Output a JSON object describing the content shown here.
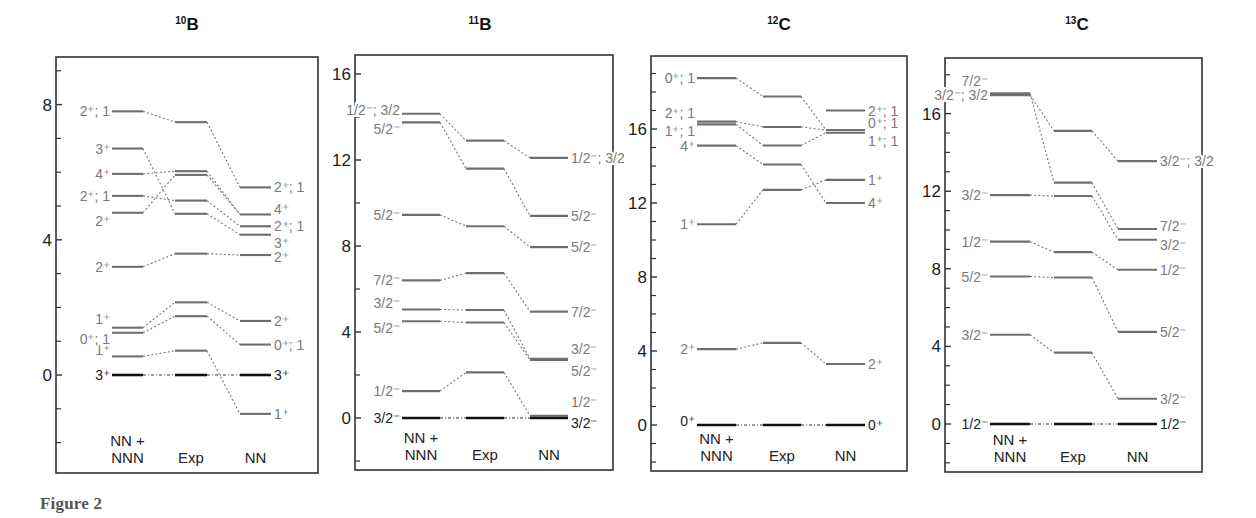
{
  "caption": "Figure 2",
  "colors": {
    "axis": "#333333",
    "level": "#6e6e6e",
    "ground": "#111111",
    "label": "#7a7a7a",
    "ground_label": "#222222",
    "tick_label": "#222222",
    "connector": "#777777"
  },
  "chart_data": [
    {
      "type": "level-scheme",
      "title": "10B",
      "title_mass": "10",
      "title_element": "B",
      "ylabel": "Excitation energy (MeV)",
      "ylim": [
        -2.9,
        9.6
      ],
      "yticks_major": [
        0,
        4,
        8
      ],
      "yticks_minor": [
        -2,
        -1,
        1,
        2,
        3,
        5,
        6,
        7,
        9
      ],
      "columns": [
        "NN +\nNNN",
        "Exp",
        "NN"
      ],
      "column_labels": [
        [
          "NN +",
          "NNN"
        ],
        [
          "Exp"
        ],
        [
          "NN"
        ]
      ],
      "series": [
        {
          "name": "NN + NNN",
          "levels": [
            {
              "E": 0.0,
              "label": "3⁺",
              "ground": true
            },
            {
              "E": 0.55,
              "label": "1⁺"
            },
            {
              "E": 1.25,
              "label": "0⁺; 1"
            },
            {
              "E": 1.4,
              "label": "1⁺"
            },
            {
              "E": 3.2,
              "label": "2⁺"
            },
            {
              "E": 4.8,
              "label": "2⁺"
            },
            {
              "E": 5.3,
              "label": "2⁺; 1"
            },
            {
              "E": 5.95,
              "label": "4⁺"
            },
            {
              "E": 6.7,
              "label": "3⁺"
            },
            {
              "E": 7.8,
              "label": "2⁺; 1"
            }
          ]
        },
        {
          "name": "Exp",
          "levels": [
            {
              "E": 0.0,
              "ground": true
            },
            {
              "E": 0.72
            },
            {
              "E": 1.74
            },
            {
              "E": 2.15
            },
            {
              "E": 3.59
            },
            {
              "E": 4.77
            },
            {
              "E": 5.16
            },
            {
              "E": 5.92
            },
            {
              "E": 6.03
            },
            {
              "E": 7.48
            }
          ]
        },
        {
          "name": "NN",
          "levels": [
            {
              "E": -1.15,
              "label": "1⁺"
            },
            {
              "E": 0.0,
              "label": "3⁺",
              "ground": true
            },
            {
              "E": 0.9,
              "label": "0⁺; 1"
            },
            {
              "E": 1.6,
              "label": "2⁺"
            },
            {
              "E": 3.55,
              "label": "2⁺"
            },
            {
              "E": 4.15,
              "label": "3⁺"
            },
            {
              "E": 4.4,
              "label": "2⁺; 1"
            },
            {
              "E": 4.75,
              "label": "4⁺"
            },
            {
              "E": 5.55,
              "label": "2⁺; 1"
            }
          ]
        }
      ],
      "connections": [
        [
          0,
          0,
          0
        ],
        [
          1,
          1,
          -1.15
        ],
        [
          2,
          2,
          0.9
        ],
        [
          3,
          3,
          1.6
        ],
        [
          4,
          4,
          3.55
        ],
        [
          5,
          8,
          4.75
        ],
        [
          6,
          6,
          4.4
        ],
        [
          7,
          7,
          4.15
        ],
        [
          8,
          9,
          5.55
        ],
        [
          9,
          5,
          3.55
        ]
      ]
    },
    {
      "type": "level-scheme",
      "title": "11B",
      "title_mass": "11",
      "title_element": "B",
      "ylabel": "Excitation energy (MeV)",
      "ylim": [
        -2.5,
        16.8
      ],
      "yticks_major": [
        0,
        4,
        8,
        12,
        16
      ],
      "yticks_minor": [
        -2,
        2,
        6,
        10,
        14
      ],
      "columns": [
        "NN +\nNNN",
        "Exp",
        "NN"
      ],
      "column_labels": [
        [
          "NN +",
          "NNN"
        ],
        [
          "Exp"
        ],
        [
          "NN"
        ]
      ],
      "series": [
        {
          "name": "NN + NNN",
          "levels": [
            {
              "E": 0.0,
              "label": "3/2⁻",
              "ground": true
            },
            {
              "E": 1.25,
              "label": "1/2⁻"
            },
            {
              "E": 4.5,
              "label": "5/2⁻"
            },
            {
              "E": 5.05,
              "label": "3/2⁻"
            },
            {
              "E": 6.4,
              "label": "7/2⁻"
            },
            {
              "E": 9.45,
              "label": "5/2⁻"
            },
            {
              "E": 13.75,
              "label": "5/2⁻"
            },
            {
              "E": 14.15,
              "label": "1/2⁻; 3/2"
            }
          ]
        },
        {
          "name": "Exp",
          "levels": [
            {
              "E": 0.0,
              "ground": true
            },
            {
              "E": 2.12
            },
            {
              "E": 4.44
            },
            {
              "E": 5.02
            },
            {
              "E": 6.74
            },
            {
              "E": 8.92
            },
            {
              "E": 11.6
            },
            {
              "E": 12.9
            }
          ]
        },
        {
          "name": "NN",
          "levels": [
            {
              "E": 0.0,
              "label": "3/2⁻",
              "ground": true
            },
            {
              "E": 0.1,
              "label": "1/2⁻"
            },
            {
              "E": 2.7,
              "label": "5/2⁻"
            },
            {
              "E": 2.75,
              "label": "3/2⁻"
            },
            {
              "E": 4.95,
              "label": "7/2⁻"
            },
            {
              "E": 7.95,
              "label": "5/2⁻"
            },
            {
              "E": 9.4,
              "label": "5/2⁻"
            },
            {
              "E": 12.1,
              "label": "1/2⁻; 3/2"
            }
          ]
        }
      ]
    },
    {
      "type": "level-scheme",
      "title": "12C",
      "title_mass": "12",
      "title_element": "C",
      "ylabel": "Excitation energy (MeV)",
      "ylim": [
        -2.5,
        20.0
      ],
      "yticks_major": [
        0,
        4,
        8,
        12,
        16
      ],
      "yticks_minor": [
        -2,
        -1,
        1,
        2,
        3,
        5,
        6,
        7,
        9,
        10,
        11,
        13,
        14,
        15,
        17,
        18,
        19
      ],
      "columns": [
        "NN +\nNNN",
        "Exp",
        "NN"
      ],
      "column_labels": [
        [
          "NN +",
          "NNN"
        ],
        [
          "Exp"
        ],
        [
          "NN"
        ]
      ],
      "series": [
        {
          "name": "NN + NNN",
          "levels": [
            {
              "E": 0.0,
              "label": "0⁺",
              "ground": true
            },
            {
              "E": 4.1,
              "label": "2⁺"
            },
            {
              "E": 10.85,
              "label": "1⁺"
            },
            {
              "E": 15.1,
              "label": "4⁺"
            },
            {
              "E": 16.25,
              "label": "1⁺; 1"
            },
            {
              "E": 16.4,
              "label": "2⁺; 1"
            },
            {
              "E": 18.75,
              "label": "0⁺; 1"
            }
          ]
        },
        {
          "name": "Exp",
          "levels": [
            {
              "E": 0.0,
              "ground": true
            },
            {
              "E": 4.44
            },
            {
              "E": 12.71
            },
            {
              "E": 14.08
            },
            {
              "E": 15.11
            },
            {
              "E": 16.11
            },
            {
              "E": 17.76
            }
          ]
        },
        {
          "name": "NN",
          "levels": [
            {
              "E": 0.0,
              "label": "0⁺",
              "ground": true
            },
            {
              "E": 3.3,
              "label": "2⁺"
            },
            {
              "E": 12.0,
              "label": "4⁺"
            },
            {
              "E": 13.25,
              "label": "1⁺"
            },
            {
              "E": 15.8,
              "label": "1⁺; 1"
            },
            {
              "E": 15.95,
              "label": "0⁺; 1"
            },
            {
              "E": 17.0,
              "label": "2⁺; 1"
            }
          ]
        }
      ]
    },
    {
      "type": "level-scheme",
      "title": "13C",
      "title_mass": "13",
      "title_element": "C",
      "ylabel": "Excitation energy (MeV)",
      "ylim": [
        -2.5,
        18.8
      ],
      "yticks_major": [
        0,
        4,
        8,
        12,
        16
      ],
      "yticks_minor": [
        -2,
        -1,
        1,
        2,
        3,
        5,
        6,
        7,
        9,
        10,
        11,
        13,
        14,
        15,
        17,
        18
      ],
      "columns": [
        "NN +\nNNN",
        "Exp",
        "NN"
      ],
      "column_labels": [
        [
          "NN +",
          "NNN"
        ],
        [
          "Exp"
        ],
        [
          "NN"
        ]
      ],
      "series": [
        {
          "name": "NN + NNN",
          "levels": [
            {
              "E": 0.0,
              "label": "1/2⁻",
              "ground": true
            },
            {
              "E": 4.6,
              "label": "3/2⁻"
            },
            {
              "E": 7.6,
              "label": "5/2⁻"
            },
            {
              "E": 9.4,
              "label": "1/2⁻"
            },
            {
              "E": 11.8,
              "label": "3/2⁻"
            },
            {
              "E": 16.95,
              "label": "3/2⁻; 3/2"
            },
            {
              "E": 17.05,
              "label": "7/2⁻"
            }
          ]
        },
        {
          "name": "Exp",
          "levels": [
            {
              "E": 0.0,
              "ground": true
            },
            {
              "E": 3.68
            },
            {
              "E": 7.55
            },
            {
              "E": 8.86
            },
            {
              "E": 11.75
            },
            {
              "E": 12.44
            },
            {
              "E": 15.11
            }
          ]
        },
        {
          "name": "NN",
          "levels": [
            {
              "E": 0.0,
              "label": "1/2⁻",
              "ground": true
            },
            {
              "E": 1.3,
              "label": "3/2⁻"
            },
            {
              "E": 4.75,
              "label": "5/2⁻"
            },
            {
              "E": 7.95,
              "label": "1/2⁻"
            },
            {
              "E": 9.5,
              "label": "3/2⁻"
            },
            {
              "E": 10.05,
              "label": "7/2⁻"
            },
            {
              "E": 13.55,
              "label": "3/2⁻; 3/2"
            }
          ]
        }
      ]
    }
  ]
}
